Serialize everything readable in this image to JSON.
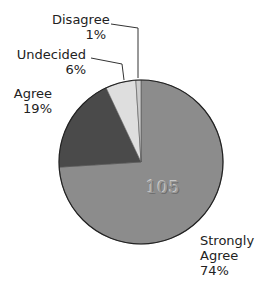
{
  "chart_data": {
    "type": "pie",
    "title": "",
    "categories": [
      "Strongly Agree",
      "Agree",
      "Undecided",
      "Disagree"
    ],
    "values": [
      74,
      19,
      6,
      1
    ],
    "unit": "%",
    "colors": [
      "#8c8c8c",
      "#4a4a4a",
      "#dedede",
      "#cccccc"
    ],
    "annotation": "105",
    "legend": "none (direct labels)",
    "labels": [
      {
        "name": "Strongly Agree",
        "line1": "Strongly",
        "line2": "Agree",
        "pct": "74%"
      },
      {
        "name": "Agree",
        "line1": "Agree",
        "pct": "19%"
      },
      {
        "name": "Undecided",
        "line1": "Undecided",
        "pct": "6%"
      },
      {
        "name": "Disagree",
        "line1": "Disagree",
        "pct": "1%"
      }
    ]
  }
}
